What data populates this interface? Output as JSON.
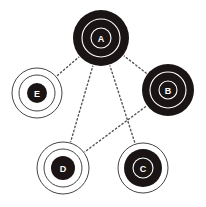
{
  "diagram": {
    "type": "network-graph",
    "colors": {
      "background": "#ffffff",
      "fill": "#1a1414",
      "ring_on_dark": "#ffffff",
      "ring_on_light": "#444444",
      "edge": "#555555"
    },
    "nodes": [
      {
        "id": "A",
        "label": "A",
        "style": "filled",
        "cx": 101,
        "cy": 38,
        "r_fill": 28,
        "rings": [
          19,
          10
        ]
      },
      {
        "id": "B",
        "label": "B",
        "style": "filled",
        "cx": 168,
        "cy": 90,
        "r_fill": 26,
        "rings": [
          18,
          9
        ]
      },
      {
        "id": "C",
        "label": "C",
        "style": "filled-with-outer-ring",
        "cx": 143,
        "cy": 168,
        "r_fill": 19,
        "outer_rings": [
          25
        ],
        "rings": [
          10
        ]
      },
      {
        "id": "D",
        "label": "D",
        "style": "outlined",
        "cx": 63,
        "cy": 168,
        "r_fill": 12,
        "outer_rings": [
          26,
          19
        ]
      },
      {
        "id": "E",
        "label": "E",
        "style": "outlined",
        "cx": 37,
        "cy": 93,
        "r_fill": 10,
        "outer_rings": [
          25,
          18
        ]
      }
    ],
    "edges": [
      {
        "from": "A",
        "to": "E"
      },
      {
        "from": "A",
        "to": "B"
      },
      {
        "from": "A",
        "to": "D"
      },
      {
        "from": "A",
        "to": "C"
      },
      {
        "from": "B",
        "to": "D"
      }
    ]
  }
}
